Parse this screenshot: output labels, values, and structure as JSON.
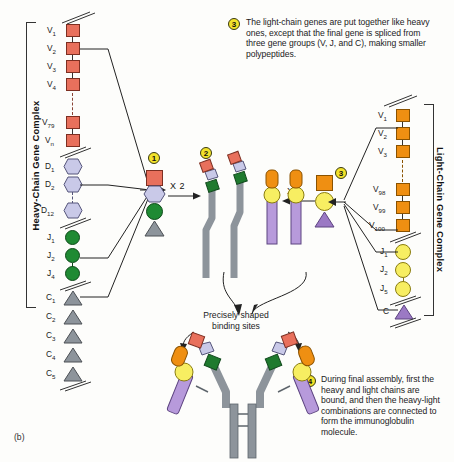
{
  "figure": {
    "label": "(b)"
  },
  "steps": [
    {
      "n": "1"
    },
    {
      "n": "2"
    },
    {
      "n": "3",
      "text": "The light-chain genes are put together like heavy ones, except that the final gene is spliced from three gene groups (V, J, and C), making smaller polypeptides."
    },
    {
      "n": "4",
      "text": "During final assembly, first the heavy and light chains are bound, and then the heavy-light combinations are connected to form the immunoglobulin molecule."
    }
  ],
  "heavy_complex": {
    "title": "Heavy-Chain Gene Complex",
    "v_segments": [
      "V1",
      "V2",
      "V3",
      "V4",
      "V79",
      "Vn"
    ],
    "d_segments": [
      "D1",
      "D2",
      "D12"
    ],
    "j_segments": [
      "J1",
      "J2",
      "J4"
    ],
    "c_segments": [
      "C1",
      "C2",
      "C3",
      "C4",
      "C5"
    ]
  },
  "light_complex": {
    "title": "Light-Chain Gene Complex",
    "v_segments": [
      "V1",
      "V2",
      "V3",
      "V98",
      "V99",
      "V100"
    ],
    "j_segments": [
      "J1",
      "J2",
      "J5"
    ],
    "c_segments": [
      "C"
    ]
  },
  "operators": {
    "heavy_x2": "X 2",
    "light_x2": "X 2"
  },
  "annotations": {
    "binding_sites": "Precisely shaped\nbinding sites"
  },
  "colors": {
    "v_heavy": "#e8705c",
    "d_heavy": "#c9c9e8",
    "j_heavy": "#1f8a33",
    "c_heavy": "#8a8f96",
    "v_light": "#ef8f12",
    "j_light": "#f7ee62",
    "c_light": "#9b79c4",
    "badge": "#f2e22a",
    "chain_gray": "#8d949b"
  }
}
